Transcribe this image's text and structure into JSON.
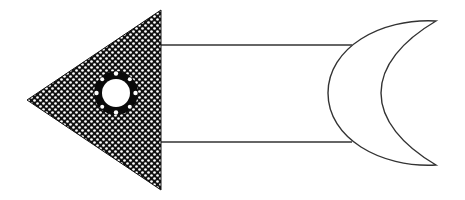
{
  "diagram": {
    "colors": {
      "background": "#ffffff",
      "stroke": "#333333",
      "head_fill": "#111111",
      "dot_fill": "#ffffff"
    },
    "parts": [
      {
        "name": "arrowhead",
        "shape": "triangle",
        "pattern": "dotted"
      },
      {
        "name": "hole",
        "shape": "ring",
        "dots": 8
      },
      {
        "name": "shaft",
        "shape": "rectangle"
      },
      {
        "name": "tail",
        "shape": "crescent"
      }
    ]
  }
}
